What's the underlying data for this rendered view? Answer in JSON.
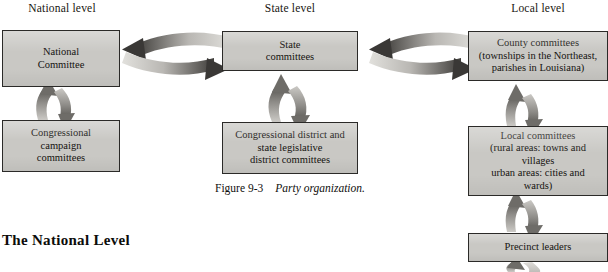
{
  "figure": {
    "columns": [
      {
        "name": "national",
        "label": "National level"
      },
      {
        "name": "state",
        "label": "State level"
      },
      {
        "name": "local",
        "label": "Local level"
      }
    ],
    "nodes": [
      {
        "id": "national-committee",
        "column": "national",
        "text": "National\nCommittee"
      },
      {
        "id": "congressional-campaign-committees",
        "column": "national",
        "text": "Congressional\ncampaign\ncommittees"
      },
      {
        "id": "state-committees",
        "column": "state",
        "text": "State\ncommittees"
      },
      {
        "id": "congressional-district-committees",
        "column": "state",
        "text": "Congressional district and\nstate legislative\ndistrict committees"
      },
      {
        "id": "county-committees",
        "column": "local",
        "text": "County committees\n(townships in the Northeast,\nparishes in Louisiana)"
      },
      {
        "id": "local-committees",
        "column": "local",
        "text": "Local committees\n(rural areas: towns and\nvillages\nurban areas: cities and\nwards)"
      },
      {
        "id": "precinct-leaders",
        "column": "local",
        "text": "Precinct leaders"
      }
    ],
    "connections": [
      {
        "from": "national-committee",
        "to": "state-committees",
        "style": "double-curved-horizontal"
      },
      {
        "from": "state-committees",
        "to": "county-committees",
        "style": "double-curved-horizontal"
      },
      {
        "from": "national-committee",
        "to": "congressional-campaign-committees",
        "style": "double-vertical"
      },
      {
        "from": "state-committees",
        "to": "congressional-district-committees",
        "style": "double-vertical"
      },
      {
        "from": "county-committees",
        "to": "local-committees",
        "style": "double-vertical"
      },
      {
        "from": "local-committees",
        "to": "precinct-leaders",
        "style": "double-vertical"
      },
      {
        "from": "precinct-leaders",
        "to": "below-offscreen",
        "style": "double-vertical-cropped"
      }
    ],
    "colors": {
      "box_fill": "#c9c8c4",
      "box_border": "#2b2a28",
      "arrow_dark": "#4a4845",
      "arrow_light": "#d7d6d2",
      "text": "#151310",
      "page_background": "#ffffff"
    }
  },
  "caption": {
    "label": "Figure 9-3",
    "title": "Party organization."
  },
  "section_heading": "The National Level"
}
